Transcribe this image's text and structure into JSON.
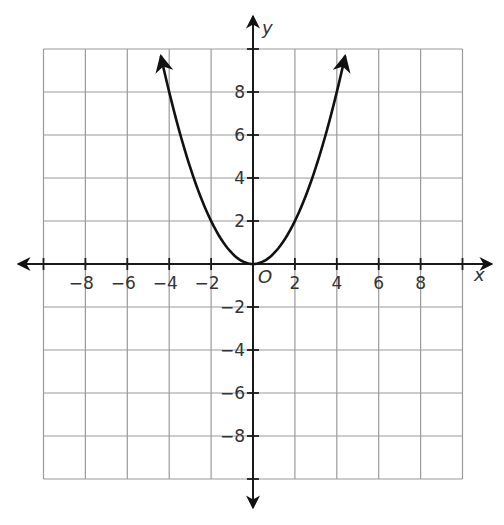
{
  "chart_data": {
    "type": "line",
    "title": "",
    "xlabel": "x",
    "ylabel": "y",
    "origin_label": "O",
    "xlim": [
      -10,
      10
    ],
    "ylim": [
      -10,
      10
    ],
    "grid": true,
    "grid_step": 2,
    "x_ticks": [
      -8,
      -6,
      -4,
      -2,
      2,
      4,
      6,
      8
    ],
    "y_ticks": [
      8,
      6,
      4,
      2,
      -2,
      -4,
      -6,
      -8
    ],
    "x_tick_labels": [
      "-8",
      "-6",
      "-4",
      "-2",
      "2",
      "4",
      "6",
      "8"
    ],
    "y_tick_labels": [
      "8",
      "6",
      "4",
      "2",
      "-2",
      "-4",
      "-6",
      "-8"
    ],
    "series": [
      {
        "name": "y = 0.5x^2",
        "equation": "y = 0.5x^2",
        "x": [
          -4.4,
          -4,
          -3,
          -2,
          -1,
          0,
          1,
          2,
          3,
          4,
          4.4
        ],
        "y": [
          9.68,
          8,
          4.5,
          2,
          0.5,
          0,
          0.5,
          2,
          4.5,
          8,
          9.68
        ],
        "arrows_at_ends": true
      }
    ]
  },
  "colors": {
    "grid": "#9a9a9a",
    "axis": "#1a1a1a",
    "curve": "#111111",
    "text": "#333333",
    "background": "#ffffff"
  }
}
